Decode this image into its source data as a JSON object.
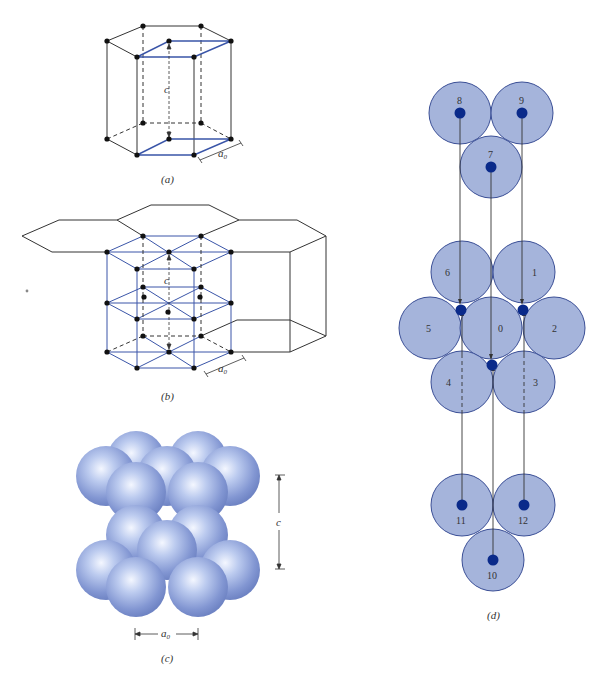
{
  "figure": {
    "colors": {
      "edge_black": "#333333",
      "edge_blue": "#3a55a8",
      "atom_dot": "#111111",
      "sphere_fill": "#8fa3d6",
      "disc_fill": "#9daed8",
      "disc_stroke": "#3b4f96",
      "disc_center": "#0a2a8a"
    },
    "panels": [
      {
        "id": "a",
        "caption": "(a)",
        "labels": {
          "height": "c",
          "edge": "a",
          "edge_sub": "0"
        }
      },
      {
        "id": "b",
        "caption": "(b)",
        "labels": {
          "height": "c",
          "edge": "a",
          "edge_sub": "0"
        }
      },
      {
        "id": "c",
        "caption": "(c)",
        "labels": {
          "height": "c",
          "edge": "a",
          "edge_sub": "0"
        }
      },
      {
        "id": "d",
        "caption": "(d)",
        "atoms": {
          "n0": "0",
          "n1": "1",
          "n2": "2",
          "n3": "3",
          "n4": "4",
          "n5": "5",
          "n6": "6",
          "n7": "7",
          "n8": "8",
          "n9": "9",
          "n10": "10",
          "n11": "11",
          "n12": "12"
        }
      }
    ]
  }
}
